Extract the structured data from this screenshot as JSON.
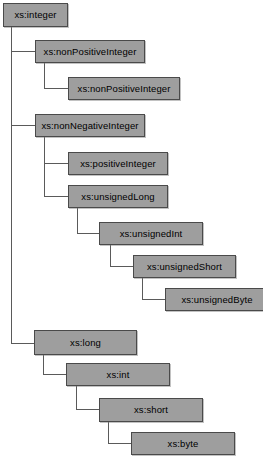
{
  "diagram": {
    "type": "tree",
    "background_color": "#ffffff",
    "node_fill_color": "#9e9e9e",
    "node_border_color": "#4a4a4a",
    "edge_color": "#5a5a5a",
    "nodes": [
      {
        "id": "integer",
        "label": "xs:integer",
        "x": 3,
        "y": 3,
        "w": 65,
        "h": 24,
        "depth": 0
      },
      {
        "id": "nonPositiveInteger",
        "label": "xs:nonPositiveInteger",
        "x": 35,
        "y": 40,
        "w": 110,
        "h": 23,
        "depth": 1
      },
      {
        "id": "negativeInteger",
        "label": "xs:nonPositiveInteger",
        "x": 68,
        "y": 77,
        "w": 112,
        "h": 23,
        "depth": 2
      },
      {
        "id": "nonNegativeInteger",
        "label": "xs:nonNegativeInteger",
        "x": 35,
        "y": 114,
        "w": 110,
        "h": 23,
        "depth": 1
      },
      {
        "id": "positiveInteger",
        "label": "xs:positiveInteger",
        "x": 68,
        "y": 152,
        "w": 100,
        "h": 23,
        "depth": 2
      },
      {
        "id": "unsignedLong",
        "label": "xs:unsignedLong",
        "x": 68,
        "y": 185,
        "w": 100,
        "h": 23,
        "depth": 2
      },
      {
        "id": "unsignedInt",
        "label": "xs:unsignedInt",
        "x": 99,
        "y": 222,
        "w": 104,
        "h": 23,
        "depth": 3
      },
      {
        "id": "unsignedShort",
        "label": "xs:unsignedShort",
        "x": 133,
        "y": 255,
        "w": 103,
        "h": 23,
        "depth": 4
      },
      {
        "id": "unsignedByte",
        "label": "xs:unsignedByte",
        "x": 165,
        "y": 288,
        "w": 104,
        "h": 23,
        "depth": 5
      },
      {
        "id": "long",
        "label": "xs:long",
        "x": 34,
        "y": 330,
        "w": 103,
        "h": 25,
        "depth": 1
      },
      {
        "id": "int",
        "label": "xs:int",
        "x": 66,
        "y": 363,
        "w": 104,
        "h": 23,
        "depth": 2
      },
      {
        "id": "short",
        "label": "xs:short",
        "x": 99,
        "y": 398,
        "w": 104,
        "h": 24,
        "depth": 3
      },
      {
        "id": "byte",
        "label": "xs:byte",
        "x": 131,
        "y": 432,
        "w": 104,
        "h": 23,
        "depth": 4
      }
    ],
    "edges": [
      {
        "from": "integer",
        "to": "nonPositiveInteger"
      },
      {
        "from": "nonPositiveInteger",
        "to": "negativeInteger"
      },
      {
        "from": "integer",
        "to": "nonNegativeInteger"
      },
      {
        "from": "nonNegativeInteger",
        "to": "positiveInteger"
      },
      {
        "from": "nonNegativeInteger",
        "to": "unsignedLong"
      },
      {
        "from": "unsignedLong",
        "to": "unsignedInt"
      },
      {
        "from": "unsignedInt",
        "to": "unsignedShort"
      },
      {
        "from": "unsignedShort",
        "to": "unsignedByte"
      },
      {
        "from": "integer",
        "to": "long"
      },
      {
        "from": "long",
        "to": "int"
      },
      {
        "from": "int",
        "to": "short"
      },
      {
        "from": "short",
        "to": "byte"
      }
    ]
  }
}
